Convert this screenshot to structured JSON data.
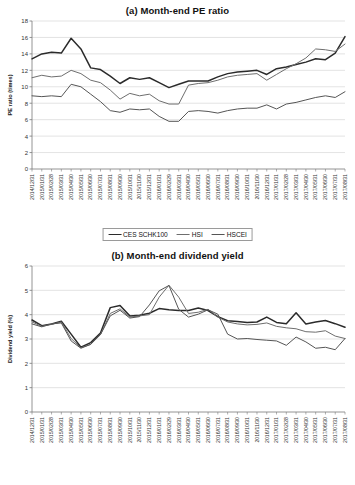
{
  "document": {
    "background": "#ffffff",
    "page_kind": "scanned-figure-page"
  },
  "series_styles": {
    "CES SCHK100": {
      "color": "#2b2b2b",
      "width": 1.5
    },
    "HSI": {
      "color": "#6e6e6e",
      "width": 1.0
    },
    "HSCEI": {
      "color": "#555555",
      "width": 1.0
    }
  },
  "legend": {
    "items": [
      {
        "label": "CES SCHK100",
        "color": "#2b2b2b",
        "width": 1.7
      },
      {
        "label": "HSI",
        "color": "#6e6e6e",
        "width": 1.1
      },
      {
        "label": "HSCEI",
        "color": "#555555",
        "width": 1.1
      }
    ]
  },
  "categories": [
    "2014/12/31",
    "2015/01/31",
    "2015/02/28",
    "2015/03/31",
    "2015/04/30",
    "2015/05/31",
    "2015/06/30",
    "2015/07/31",
    "2015/08/31",
    "2015/09/30",
    "2015/10/31",
    "2015/11/30",
    "2015/12/31",
    "2016/01/31",
    "2016/02/29",
    "2016/03/31",
    "2016/04/30",
    "2016/05/31",
    "2016/06/30",
    "2016/07/31",
    "2016/08/31",
    "2016/09/30",
    "2016/10/31",
    "2016/11/30",
    "2016/12/31",
    "2017/01/31",
    "2017/02/28",
    "2017/03/31",
    "2017/04/30",
    "2017/05/31",
    "2017/06/30",
    "2017/07/31",
    "2017/08/31"
  ],
  "chart_data": [
    {
      "id": "pe-ratio",
      "type": "line",
      "title": "(a) Month-end PE ratio",
      "xlabel": "",
      "ylabel": "PE ratio (times)",
      "ylim": [
        0,
        18
      ],
      "ytick_step": 2,
      "yticks": [
        0,
        2,
        4,
        6,
        8,
        10,
        12,
        14,
        16,
        18
      ],
      "grid": "horizontal",
      "legend_position": "bottom",
      "categories": [
        "2014/12/31",
        "2015/01/31",
        "2015/02/28",
        "2015/03/31",
        "2015/04/30",
        "2015/05/31",
        "2015/06/30",
        "2015/07/31",
        "2015/08/31",
        "2015/09/30",
        "2015/10/31",
        "2015/11/30",
        "2015/12/31",
        "2016/01/31",
        "2016/02/29",
        "2016/03/31",
        "2016/04/30",
        "2016/05/31",
        "2016/06/30",
        "2016/07/31",
        "2016/08/31",
        "2016/09/30",
        "2016/10/31",
        "2016/11/30",
        "2016/12/31",
        "2017/01/31",
        "2017/02/28",
        "2017/03/31",
        "2017/04/30",
        "2017/05/31",
        "2017/06/30",
        "2017/07/31",
        "2017/08/31"
      ],
      "series": [
        {
          "name": "CES SCHK100",
          "values": [
            13.4,
            14.0,
            14.2,
            14.1,
            15.9,
            14.6,
            12.3,
            12.1,
            11.3,
            10.4,
            11.1,
            10.9,
            11.1,
            10.5,
            9.9,
            10.3,
            10.7,
            10.7,
            10.7,
            11.2,
            11.6,
            11.8,
            11.9,
            12.0,
            11.5,
            12.2,
            12.4,
            12.7,
            13.0,
            13.4,
            13.3,
            14.1,
            16.1
          ]
        },
        {
          "name": "HSI",
          "values": [
            11.1,
            11.4,
            11.2,
            11.3,
            12.0,
            11.6,
            10.8,
            10.5,
            9.6,
            8.5,
            9.2,
            8.9,
            9.1,
            8.3,
            7.9,
            7.9,
            10.2,
            10.4,
            10.5,
            10.8,
            11.2,
            11.4,
            11.5,
            11.6,
            10.8,
            11.5,
            12.2,
            12.8,
            13.5,
            14.6,
            14.5,
            14.3,
            15.2
          ]
        },
        {
          "name": "HSCEI",
          "values": [
            8.9,
            8.8,
            8.9,
            8.8,
            10.3,
            10.0,
            9.1,
            8.2,
            7.1,
            6.9,
            7.3,
            7.2,
            7.3,
            6.4,
            5.8,
            5.8,
            7.0,
            7.1,
            7.0,
            6.8,
            7.1,
            7.3,
            7.4,
            7.4,
            7.8,
            7.3,
            7.9,
            8.1,
            8.4,
            8.7,
            8.9,
            8.7,
            9.4
          ]
        }
      ]
    },
    {
      "id": "dividend-yield",
      "type": "line",
      "title": "(b) Month-end dividend yield",
      "xlabel": "",
      "ylabel": "Dividend yield (%)",
      "ylim": [
        0,
        6
      ],
      "ytick_step": 1,
      "yticks": [
        0,
        1,
        2,
        3,
        4,
        5,
        6
      ],
      "grid": "horizontal",
      "legend_position": "bottom",
      "categories": [
        "2014/12/31",
        "2015/01/31",
        "2015/02/28",
        "2015/03/31",
        "2015/04/30",
        "2015/05/31",
        "2015/06/30",
        "2015/07/31",
        "2015/08/31",
        "2015/09/30",
        "2015/10/31",
        "2015/11/30",
        "2015/12/31",
        "2016/01/31",
        "2016/02/29",
        "2016/03/31",
        "2016/04/30",
        "2016/05/31",
        "2016/06/30",
        "2016/07/31",
        "2016/08/31",
        "2016/09/30",
        "2016/10/31",
        "2016/11/30",
        "2016/12/31",
        "2017/01/31",
        "2017/02/28",
        "2017/03/31",
        "2017/04/30",
        "2017/05/31",
        "2017/06/30",
        "2017/07/31",
        "2017/08/31"
      ],
      "series": [
        {
          "name": "CES SCHK100",
          "values": [
            3.78,
            3.55,
            3.62,
            3.73,
            3.2,
            2.66,
            2.85,
            3.25,
            4.29,
            4.38,
            3.95,
            3.98,
            4.06,
            4.25,
            4.2,
            4.17,
            4.17,
            4.27,
            4.17,
            3.92,
            3.75,
            3.72,
            3.68,
            3.7,
            3.9,
            3.68,
            3.63,
            4.08,
            3.62,
            3.7,
            3.76,
            3.63,
            3.48
          ]
        },
        {
          "name": "HSI",
          "values": [
            3.7,
            3.52,
            3.6,
            3.7,
            3.02,
            2.64,
            2.78,
            3.18,
            4.05,
            4.24,
            3.9,
            3.95,
            4.0,
            4.72,
            5.21,
            4.72,
            4.05,
            4.1,
            4.22,
            3.9,
            3.7,
            3.62,
            3.58,
            3.6,
            3.66,
            3.52,
            3.46,
            3.42,
            3.3,
            3.28,
            3.34,
            3.12,
            3.02
          ]
        },
        {
          "name": "HSCEI",
          "values": [
            3.62,
            3.5,
            3.62,
            3.66,
            2.92,
            2.62,
            2.78,
            3.18,
            3.95,
            4.18,
            3.86,
            3.92,
            4.4,
            4.98,
            5.2,
            4.22,
            3.9,
            4.02,
            4.2,
            4.02,
            3.2,
            3.0,
            3.02,
            2.98,
            2.95,
            2.92,
            2.74,
            3.08,
            2.88,
            2.62,
            2.66,
            2.56,
            3.02
          ]
        }
      ]
    }
  ]
}
